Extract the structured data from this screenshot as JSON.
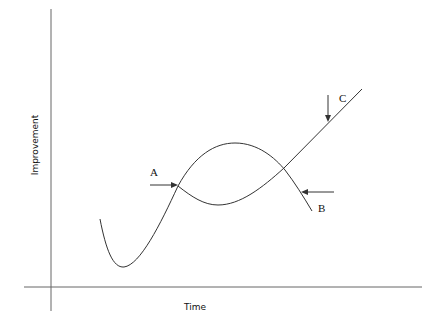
{
  "diagram": {
    "type": "curve-diagram",
    "axes": {
      "x_label": "Time",
      "y_label": "Improvement"
    },
    "annotations": [
      {
        "id": "A",
        "label": "A",
        "description": "Arrow pointing right at first curve intersection"
      },
      {
        "id": "B",
        "label": "B",
        "description": "Arrow pointing left at descending curve"
      },
      {
        "id": "C",
        "label": "C",
        "description": "Arrow pointing down at rising straight line"
      }
    ],
    "colors": {
      "line": "#333333",
      "axis": "#666666",
      "background": "#ffffff"
    }
  }
}
